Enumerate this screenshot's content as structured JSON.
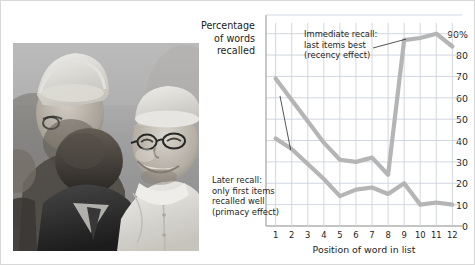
{
  "credit": "Vincenzo Pinto/AFP/Getty Images",
  "photo": {
    "alt_name": "pope-greeting-crowd-photo",
    "description": "Grayscale photograph of Pope Francis smiling while greeting people in a crowd",
    "palette": [
      "#efefef",
      "#c9c9c9",
      "#9b9b9b",
      "#6d6d6d",
      "#3f3f3f",
      "#202020"
    ]
  },
  "axis_title_lines": [
    "Percentage",
    "of words",
    "recalled"
  ],
  "chart_data": {
    "type": "line",
    "title": "",
    "xlabel": "Position of word in list",
    "ylabel": "Percentage of words recalled",
    "x": [
      1,
      2,
      3,
      4,
      5,
      6,
      7,
      8,
      9,
      10,
      11,
      12
    ],
    "xtick_labels": [
      "1",
      "2",
      "3",
      "4",
      "5",
      "6",
      "7",
      "8",
      "9",
      "10",
      "11",
      "12"
    ],
    "ytick_labels": [
      "90%",
      "80",
      "70",
      "60",
      "50",
      "40",
      "30",
      "20",
      "10",
      "0"
    ],
    "yticks": [
      90,
      80,
      70,
      60,
      50,
      40,
      30,
      20,
      10,
      0
    ],
    "ylim": [
      0,
      95
    ],
    "xlim": [
      0.4,
      12.6
    ],
    "grid": true,
    "legend_position": "none",
    "series": [
      {
        "name": "Immediate recall",
        "color": "#b5b5b5",
        "values": [
          69,
          59,
          49,
          39,
          31,
          30,
          32,
          24,
          87,
          88,
          90,
          84
        ]
      },
      {
        "name": "Later recall",
        "color": "#b5b5b5",
        "values": [
          41,
          36,
          29,
          22,
          14,
          17,
          18,
          15,
          20,
          10,
          11,
          10
        ]
      }
    ],
    "annotations": [
      {
        "name": "immediate-recall-annotation",
        "text": "Immediate recall:\nlast items best\n(recency effect)",
        "points_to_series": "Immediate recall",
        "points_to_x": 9
      },
      {
        "name": "later-recall-annotation",
        "text": "Later recall:\nonly first items\nrecalled well\n(primacy effect)",
        "points_to_series": "Later recall",
        "points_to_x": 2
      }
    ],
    "colors": {
      "line": "#b5b5b5",
      "grid": "#ccd3dd",
      "axis": "#b0b0b0",
      "text": "#1d1d1d",
      "background": "#ffffff"
    }
  }
}
